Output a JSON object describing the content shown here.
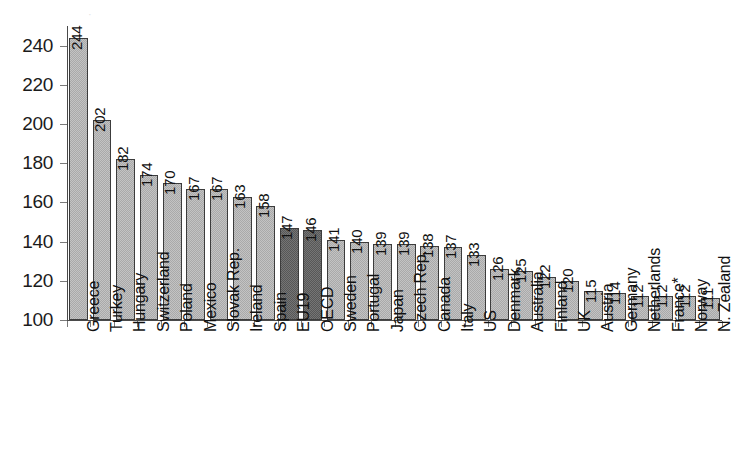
{
  "chart_data": {
    "type": "bar",
    "title": "",
    "subtitle": "",
    "xlabel": "",
    "ylabel": "",
    "ylim": [
      100,
      250
    ],
    "yticks": [
      100,
      120,
      140,
      160,
      180,
      200,
      220,
      240
    ],
    "grid": false,
    "legend": "none",
    "orientation": "vertical",
    "value_labels": true,
    "categories": [
      "Greece",
      "Turkey",
      "Hungary",
      "Switzerland",
      "Poland",
      "Mexico",
      "Slovak Rep.",
      "Ireland",
      "Spain",
      "EU19",
      "OECD",
      "Sweden",
      "Portugal",
      "Japan",
      "Czech Rep.",
      "Canada",
      "Italy",
      "US",
      "Denmark",
      "Australia",
      "Finland",
      "UK",
      "Austria",
      "Germany",
      "Netherlands",
      "France*",
      "Norway",
      "N. Zealand"
    ],
    "values": [
      244,
      202,
      182,
      174,
      170,
      167,
      167,
      163,
      158,
      147,
      146,
      141,
      140,
      139,
      139,
      138,
      137,
      133,
      126,
      125,
      122,
      120,
      115,
      114,
      112,
      112,
      112,
      111
    ],
    "highlighted_categories": [
      "EU19",
      "OECD"
    ],
    "colors": {
      "bar": "#a9a9a9",
      "bar_highlight": "#575757",
      "bar_border": "#3c3c3c",
      "axis": "#4a4a4a",
      "text": "#111111",
      "background": "#ffffff"
    }
  },
  "axes": {
    "y_min_label": "100",
    "y_max_label": "240"
  },
  "artifact": {
    "top_fragment": "·"
  }
}
